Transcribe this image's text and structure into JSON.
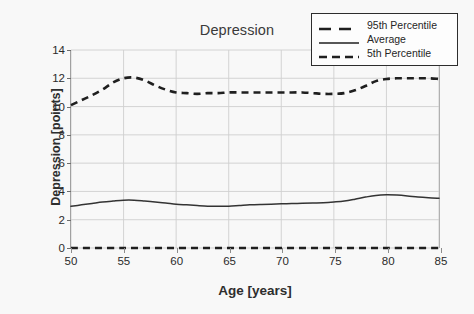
{
  "chart_data": {
    "type": "line",
    "title": "Depression",
    "xlabel": "Age [years]",
    "ylabel": "Depression [points]",
    "xlim": [
      50,
      85
    ],
    "ylim": [
      0,
      14
    ],
    "xticks": [
      50,
      55,
      60,
      65,
      70,
      75,
      80,
      85
    ],
    "yticks": [
      0,
      2,
      4,
      6,
      8,
      10,
      12,
      14
    ],
    "grid": "horizontal-and-vertical",
    "legend_position": "top-right",
    "series": [
      {
        "name": "95th Percentile",
        "style": "dashed",
        "color": "#1f1f1f",
        "x": [
          50,
          51,
          52,
          53,
          54,
          55,
          56,
          57,
          58,
          59,
          60,
          61,
          62,
          63,
          64,
          65,
          66,
          67,
          68,
          69,
          70,
          71,
          72,
          73,
          74,
          75,
          76,
          77,
          78,
          79,
          80,
          81,
          82,
          83,
          84,
          85
        ],
        "values": [
          10.1,
          10.45,
          10.8,
          11.2,
          11.7,
          12.0,
          12.05,
          11.85,
          11.5,
          11.2,
          11.0,
          10.95,
          10.9,
          10.95,
          10.95,
          11.0,
          11.0,
          11.0,
          11.0,
          11.0,
          11.0,
          11.0,
          11.0,
          10.95,
          10.9,
          10.9,
          10.95,
          11.15,
          11.45,
          11.8,
          11.95,
          12.0,
          12.0,
          12.0,
          12.0,
          11.95
        ]
      },
      {
        "name": "Average",
        "style": "solid",
        "color": "#333333",
        "x": [
          50,
          51,
          52,
          53,
          54,
          55,
          56,
          57,
          58,
          59,
          60,
          61,
          62,
          63,
          64,
          65,
          66,
          67,
          68,
          69,
          70,
          71,
          72,
          73,
          74,
          75,
          76,
          77,
          78,
          79,
          80,
          81,
          82,
          83,
          84,
          85
        ],
        "values": [
          2.95,
          3.05,
          3.15,
          3.25,
          3.32,
          3.38,
          3.38,
          3.32,
          3.25,
          3.18,
          3.1,
          3.05,
          3.0,
          2.96,
          2.95,
          2.95,
          3.0,
          3.05,
          3.08,
          3.1,
          3.12,
          3.14,
          3.16,
          3.18,
          3.2,
          3.25,
          3.32,
          3.45,
          3.6,
          3.72,
          3.76,
          3.74,
          3.68,
          3.6,
          3.55,
          3.52
        ]
      },
      {
        "name": "5th Percentile",
        "style": "dashed",
        "color": "#1f1f1f",
        "x": [
          50,
          55,
          60,
          65,
          70,
          75,
          80,
          85
        ],
        "values": [
          0,
          0,
          0,
          0,
          0,
          0,
          0,
          0
        ]
      }
    ]
  },
  "legend": {
    "items": [
      {
        "label": "95th Percentile",
        "style": "dashed"
      },
      {
        "label": "Average",
        "style": "solid"
      },
      {
        "label": "5th Percentile",
        "style": "dashed"
      }
    ]
  },
  "colors": {
    "background": "#f8f8f8",
    "grid": "#cfcfcf",
    "axis": "#7b7b7b",
    "series": "#1f1f1f",
    "text": "#2b2b2b"
  }
}
